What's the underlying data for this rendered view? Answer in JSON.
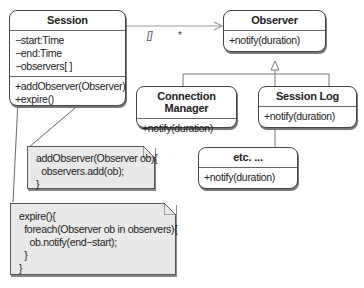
{
  "classes": {
    "session": {
      "name": "Session",
      "attributes": [
        "−start:Time",
        "−end:Time",
        "−observers[ ]"
      ],
      "operations": [
        "+addObserver(Observer)",
        "+expire()"
      ]
    },
    "observer": {
      "name": "Observer",
      "operations": [
        "+notify(duration)"
      ]
    },
    "connection_manager": {
      "name": "Connection Manager",
      "operations": [
        "+notify(duration)"
      ]
    },
    "session_log": {
      "name": "Session Log",
      "operations": [
        "+notify(duration)"
      ]
    },
    "etc": {
      "name": "etc. ...",
      "operations": [
        "+notify(duration)"
      ]
    }
  },
  "association": {
    "source_label": "[]",
    "multiplicity": "*"
  },
  "notes": {
    "add_observer": {
      "lines": [
        "addObserver(Observer ob){",
        "  observers.add(ob);",
        "}"
      ]
    },
    "expire": {
      "lines": [
        "expire(){",
        "  foreach(Observer ob in observers){",
        "    ob.notify(end−start);",
        "  }",
        "}"
      ]
    }
  },
  "colors": {
    "border": "#444444",
    "note_fill": "#e9e9e9",
    "background": "#ffffff"
  }
}
